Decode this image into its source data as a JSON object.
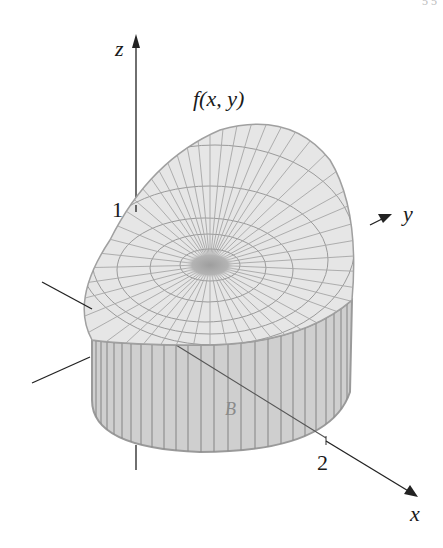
{
  "figure": {
    "page_number_fragment": "5 5",
    "function_label": "f(x, y)",
    "region_label": "B",
    "axes": {
      "z": {
        "label": "z",
        "tick_label": "1"
      },
      "y": {
        "label": "y"
      },
      "x": {
        "label": "x",
        "tick_label": "2"
      }
    },
    "colors": {
      "surface_fill": "#e6e6e6",
      "surface_grid": "#9a9a9a",
      "side_fill": "#cfcfcf",
      "side_lines": "#8a8a8a",
      "center_spot": "#a8a8a8",
      "axis": "#222222"
    }
  }
}
